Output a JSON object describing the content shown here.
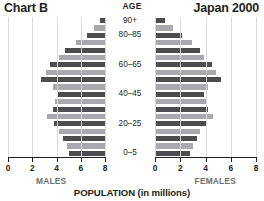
{
  "titles": {
    "left": "Chart B",
    "right": "Japan 2000",
    "age_header": "AGE",
    "x_axis": "POPULATION (in millions)",
    "males": "MALES",
    "females": "FEMALES"
  },
  "axis": {
    "left_ticks": [
      "8",
      "6",
      "4",
      "2",
      "0"
    ],
    "right_ticks": [
      "0",
      "2",
      "4",
      "6",
      "8"
    ]
  },
  "age_labels_shown": [
    "90+",
    "80–85",
    "60–65",
    "40–45",
    "20–25",
    "0–5"
  ],
  "colors": {
    "dark_bar": "#4d4d4f",
    "light_bar": "#a7a9ac",
    "grid": "#d9d9d9",
    "text": "#231f20",
    "muted_text": "#6d6e71"
  },
  "chart_data": {
    "type": "bar",
    "subtype": "population-pyramid",
    "xlabel": "POPULATION (in millions)",
    "ylabel": "AGE",
    "xlim": [
      0,
      8
    ],
    "grid": true,
    "legend_position": "none",
    "orientation": "horizontal-diverging",
    "categories": [
      "0–5",
      "5–10",
      "10–15",
      "15–20",
      "20–25",
      "25–30",
      "30–35",
      "35–40",
      "40–45",
      "45–50",
      "50–55",
      "55–60",
      "60–65",
      "65–70",
      "70–75",
      "75–80",
      "80–85",
      "85–90",
      "90+"
    ],
    "series": [
      {
        "name": "MALES",
        "side": "left",
        "values": [
          3.0,
          3.1,
          3.5,
          3.8,
          4.2,
          4.8,
          4.3,
          4.1,
          4.0,
          4.3,
          5.3,
          4.9,
          4.5,
          3.8,
          3.3,
          2.4,
          1.5,
          0.9,
          0.4
        ]
      },
      {
        "name": "FEMALES",
        "side": "right",
        "values": [
          2.8,
          3.0,
          3.3,
          3.6,
          4.1,
          4.6,
          4.2,
          4.0,
          3.9,
          4.2,
          5.2,
          4.8,
          4.5,
          3.9,
          3.6,
          2.9,
          2.1,
          1.4,
          0.8
        ]
      }
    ],
    "bar_shading": "alternating dark/light by age band, top band (90+) dark"
  }
}
